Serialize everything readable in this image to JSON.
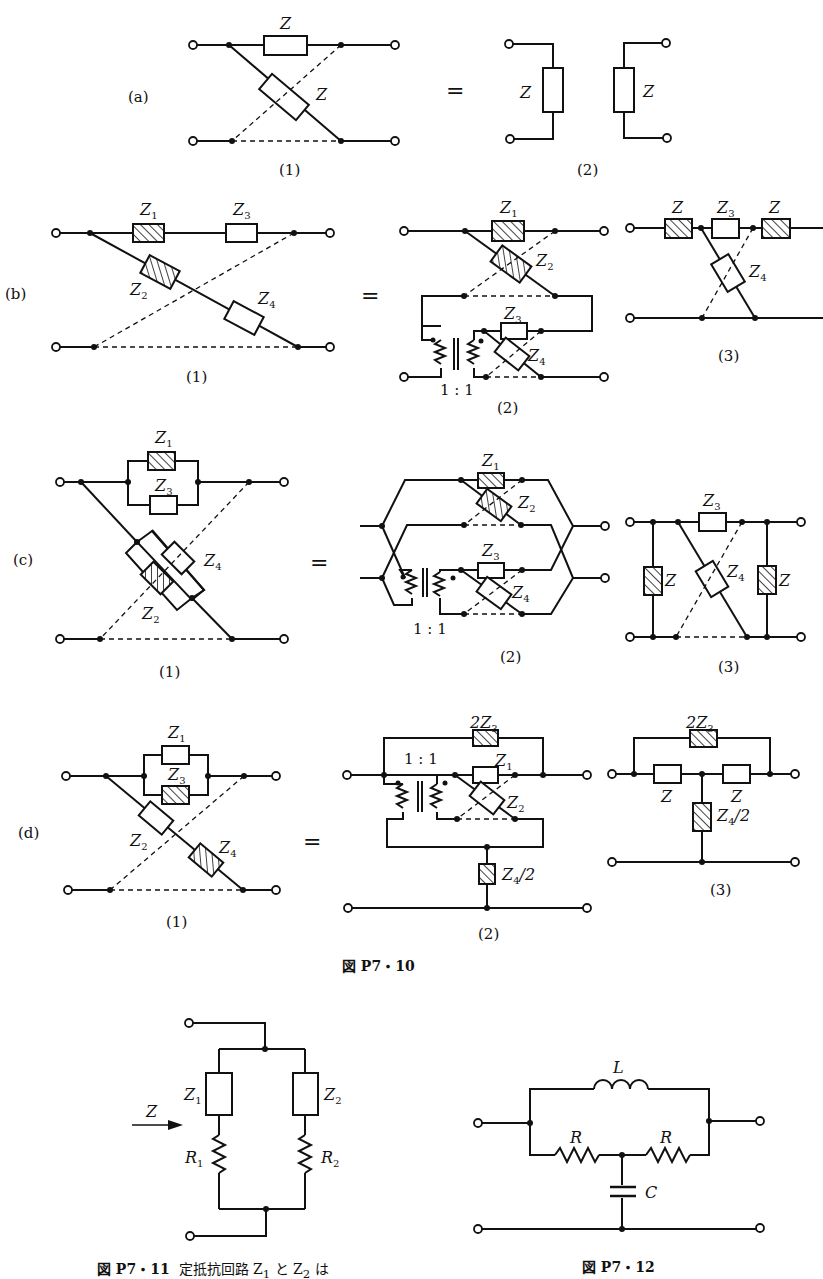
{
  "figure_p7_10": {
    "caption": "図 P7・10",
    "rows": [
      {
        "id": "a",
        "label": "(a)",
        "equals": "=",
        "sub": [
          "(1)",
          "(2)"
        ],
        "components": {
          "z_series": "Z",
          "z_cross": "Z",
          "z_left": "Z",
          "z_right": "Z"
        }
      },
      {
        "id": "b",
        "label": "(b)",
        "equals": "=",
        "sub": [
          "(1)",
          "(2)",
          "(3)"
        ],
        "components": {
          "z1": "Z",
          "z1_sub": "1",
          "z2": "Z",
          "z2_sub": "2",
          "z3": "Z",
          "z3_sub": "3",
          "z4": "Z",
          "z4_sub": "4",
          "ratio": "1 : 1",
          "z": "Z"
        }
      },
      {
        "id": "c",
        "label": "(c)",
        "equals": "=",
        "sub": [
          "(1)",
          "(2)",
          "(3)"
        ],
        "components": {
          "z1": "Z",
          "z1_sub": "1",
          "z2": "Z",
          "z2_sub": "2",
          "z3": "Z",
          "z3_sub": "3",
          "z4": "Z",
          "z4_sub": "4",
          "ratio": "1 : 1",
          "z": "Z"
        }
      },
      {
        "id": "d",
        "label": "(d)",
        "equals": "=",
        "sub": [
          "(1)",
          "(2)",
          "(3)"
        ],
        "components": {
          "z1": "Z",
          "z1_sub": "1",
          "z2": "Z",
          "z2_sub": "2",
          "z3": "Z",
          "z3_sub": "3",
          "z4": "Z",
          "z4_sub": "4",
          "two_z3": "2Z",
          "z4_half": "Z",
          "z4_half_sub": "4",
          "z4_half_tail": "/2",
          "ratio": "1 : 1",
          "z": "Z"
        }
      }
    ]
  },
  "figure_p7_11": {
    "caption": "図 P7・11",
    "caption_text": "定抵抗回路 Z",
    "caption_sub1": "1",
    "caption_mid": " と Z",
    "caption_sub2": "2",
    "caption_tail": " は",
    "labels": {
      "z": "Z",
      "z1": "Z",
      "z1_sub": "1",
      "z2": "Z",
      "z2_sub": "2",
      "r1": "R",
      "r1_sub": "1",
      "r2": "R",
      "r2_sub": "2"
    }
  },
  "figure_p7_12": {
    "caption": "図 P7・12",
    "labels": {
      "l": "L",
      "r_left": "R",
      "r_right": "R",
      "c": "C"
    }
  }
}
